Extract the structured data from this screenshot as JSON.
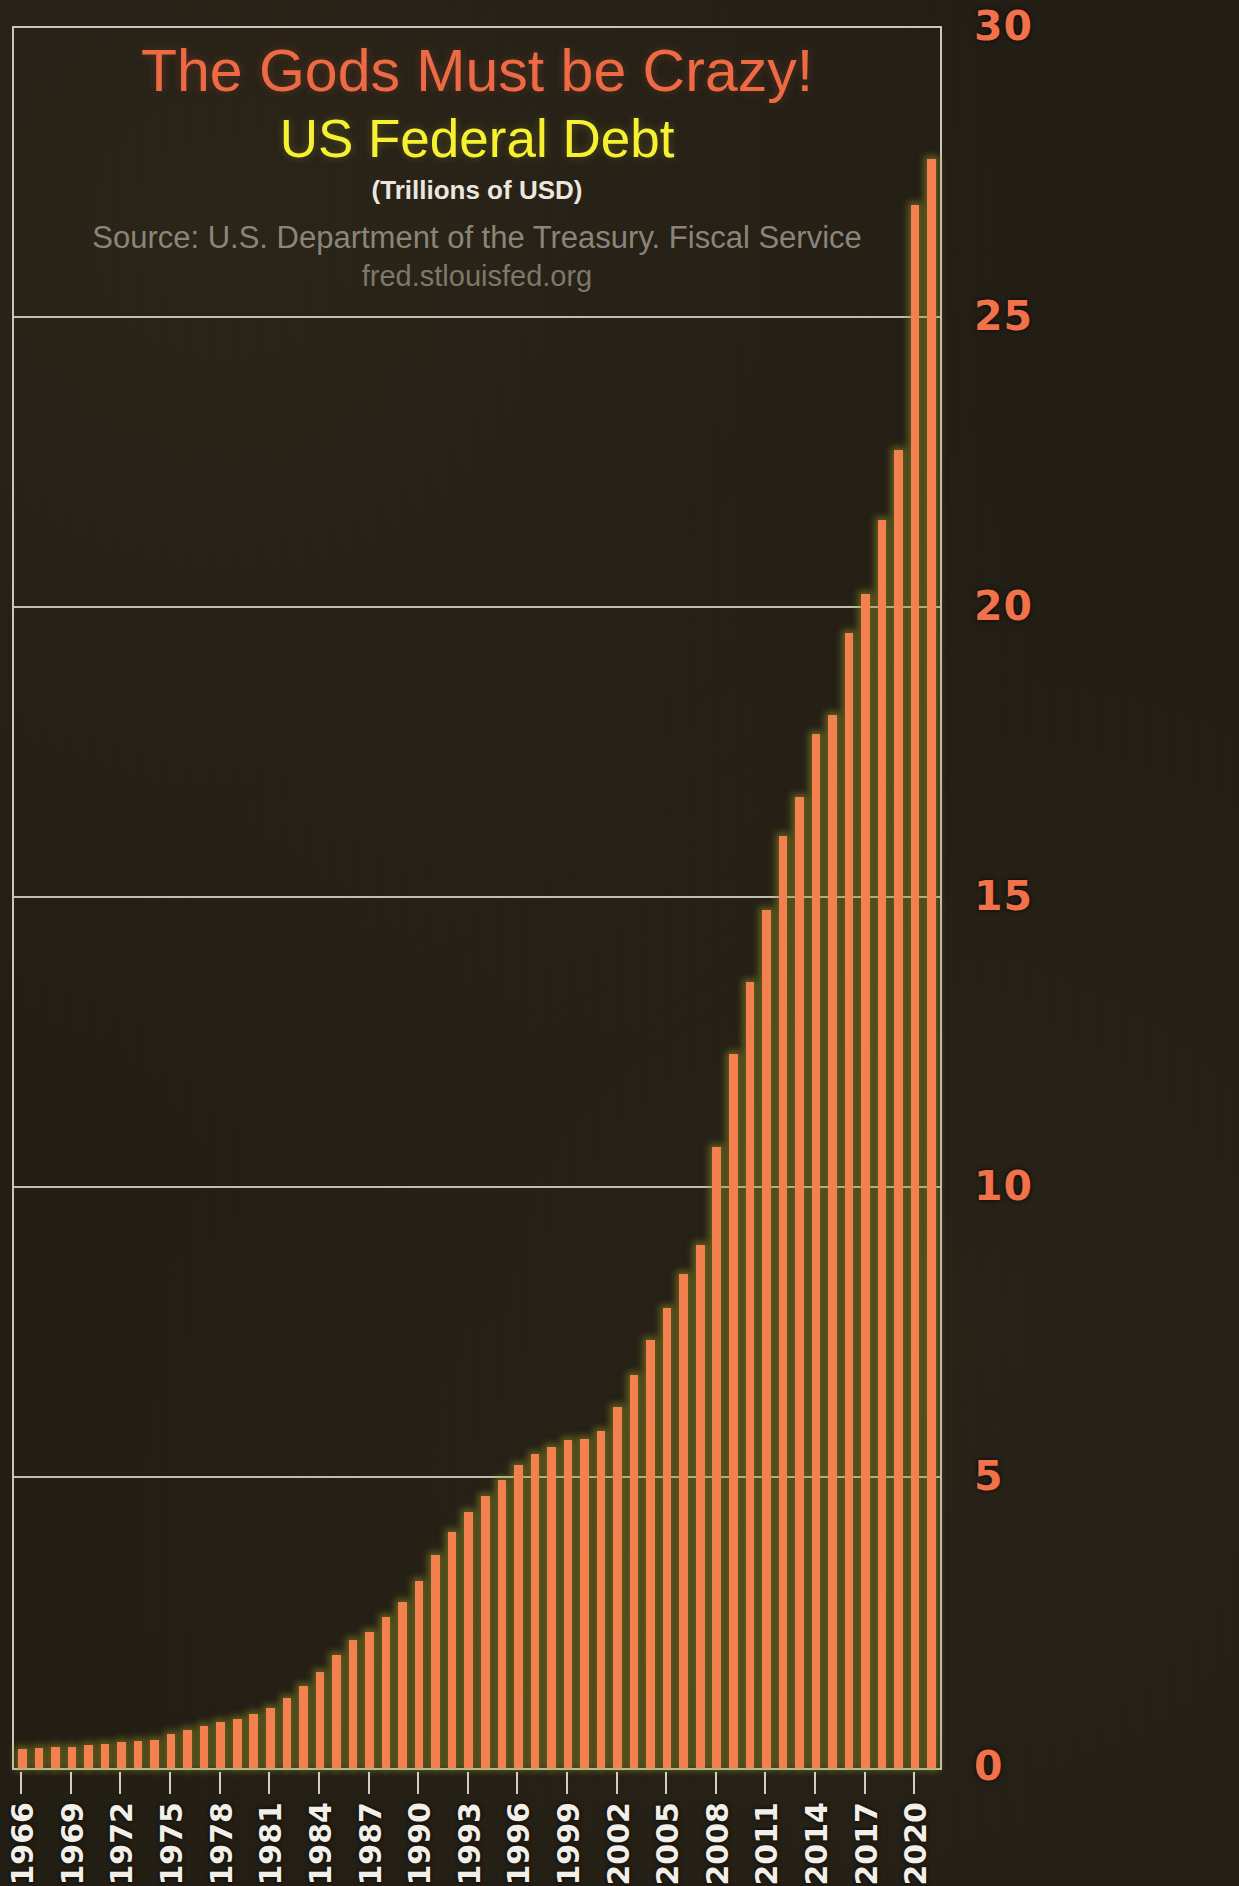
{
  "titles": {
    "main": "The Gods Must be Crazy!",
    "sub": "US Federal Debt",
    "units": "(Trillions of USD)",
    "source": "Source: U.S. Department of the Treasury. Fiscal Service",
    "url": "fred.stlouisfed.org"
  },
  "colors": {
    "title_main": "#ee6a45",
    "title_sub": "#f6f131",
    "units": "#ebe7df",
    "source": "#8b8578",
    "bar": "#f4804f",
    "glow": "#8a8a2a",
    "gridline": "#cfcbc0",
    "y_tick": "#f0714a",
    "x_tick": "#f2efe9",
    "background": "#221d14"
  },
  "chart_data": {
    "type": "bar",
    "title": "The Gods Must be Crazy! US Federal Debt",
    "subtitle": "(Trillions of USD)",
    "xlabel": "",
    "ylabel": "Trillions of USD",
    "ylim": [
      0,
      30
    ],
    "yticks": [
      0,
      5,
      10,
      15,
      20,
      25,
      30
    ],
    "ytick_labels": [
      "0",
      "5",
      "10",
      "15",
      "20",
      "25",
      "30"
    ],
    "grid": true,
    "legend": null,
    "xtick_labels": [
      "1966",
      "1969",
      "1972",
      "1975",
      "1978",
      "1981",
      "1984",
      "1987",
      "1990",
      "1993",
      "1996",
      "1999",
      "2002",
      "2005",
      "2008",
      "2011",
      "2014",
      "2017",
      "2020"
    ],
    "categories": [
      "1966",
      "1967",
      "1968",
      "1969",
      "1970",
      "1971",
      "1972",
      "1973",
      "1974",
      "1975",
      "1976",
      "1977",
      "1978",
      "1979",
      "1980",
      "1981",
      "1982",
      "1983",
      "1984",
      "1985",
      "1986",
      "1987",
      "1988",
      "1989",
      "1990",
      "1991",
      "1992",
      "1993",
      "1994",
      "1995",
      "1996",
      "1997",
      "1998",
      "1999",
      "2000",
      "2001",
      "2002",
      "2003",
      "2004",
      "2005",
      "2006",
      "2007",
      "2008",
      "2009",
      "2010",
      "2011",
      "2012",
      "2013",
      "2014",
      "2015",
      "2016",
      "2017",
      "2018",
      "2019",
      "2020",
      "2021"
    ],
    "values": [
      0.32,
      0.34,
      0.37,
      0.37,
      0.39,
      0.42,
      0.45,
      0.47,
      0.49,
      0.58,
      0.65,
      0.72,
      0.79,
      0.85,
      0.93,
      1.03,
      1.2,
      1.41,
      1.66,
      1.95,
      2.21,
      2.35,
      2.6,
      2.87,
      3.23,
      3.67,
      4.07,
      4.41,
      4.69,
      4.97,
      5.22,
      5.41,
      5.53,
      5.66,
      5.67,
      5.81,
      6.23,
      6.78,
      7.38,
      7.93,
      8.51,
      9.01,
      10.7,
      12.31,
      13.56,
      14.79,
      16.07,
      16.74,
      17.82,
      18.15,
      19.57,
      20.24,
      21.52,
      22.72,
      26.95,
      27.75
    ]
  }
}
